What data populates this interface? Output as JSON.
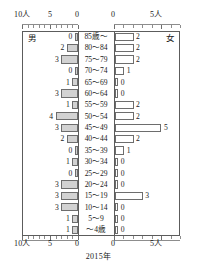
{
  "chart_data": {
    "type": "bar",
    "subtype": "population-pyramid",
    "title": "",
    "xlabel": "2015年",
    "ylabel": "",
    "unit": "人",
    "categories": [
      "85歳〜",
      "80〜84",
      "75〜79",
      "70〜74",
      "65〜69",
      "60〜64",
      "55〜59",
      "50〜54",
      "45〜49",
      "40〜44",
      "35〜39",
      "30〜34",
      "25〜29",
      "20〜24",
      "15〜19",
      "10〜14",
      "5〜9",
      "〜4歳"
    ],
    "series": [
      {
        "name": "男",
        "side": "left",
        "values": [
          0,
          2,
          3,
          0,
          1,
          3,
          1,
          4,
          3,
          2,
          0,
          1,
          0,
          3,
          3,
          3,
          1,
          1
        ]
      },
      {
        "name": "女",
        "side": "right",
        "values": [
          2,
          2,
          2,
          1,
          0,
          0,
          2,
          2,
          5,
          2,
          1,
          0,
          0,
          0,
          3,
          0,
          0,
          0
        ]
      }
    ],
    "left_axis": {
      "ticks": [
        10,
        5,
        0
      ],
      "tick_labels": [
        "10人",
        "5",
        "0"
      ],
      "max": 10,
      "minor_step": 1
    },
    "right_axis": {
      "ticks": [
        0,
        5
      ],
      "tick_labels": [
        "0",
        "5人"
      ],
      "max": 7,
      "minor_step": 1
    },
    "grid": false,
    "legend_position": "corners",
    "colors": {
      "male_fill": "#d2d2d2",
      "female_fill": "#ffffff",
      "bar_stroke": "#6d6d6d",
      "axis": "#5c5c5c"
    }
  },
  "axes": {
    "top": {
      "left_labels": [
        "10人",
        "5",
        "0"
      ],
      "right_labels": [
        "0",
        "5人"
      ]
    },
    "bottom": {
      "left_labels": [
        "10人",
        "5",
        "0"
      ],
      "right_labels": [
        "0",
        "5人"
      ]
    }
  },
  "legend": {
    "male": "男",
    "female": "女"
  },
  "footer": {
    "year": "2015年"
  }
}
